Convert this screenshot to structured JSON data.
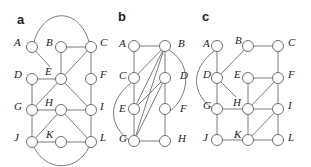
{
  "panels": [
    {
      "id": "a",
      "label": "a",
      "nodes": [
        {
          "id": "A",
          "label": "A"
        },
        {
          "id": "B",
          "label": "B"
        },
        {
          "id": "C",
          "label": "C"
        },
        {
          "id": "D",
          "label": "D"
        },
        {
          "id": "E",
          "label": "E"
        },
        {
          "id": "F",
          "label": "F"
        },
        {
          "id": "G",
          "label": "G"
        },
        {
          "id": "H",
          "label": "H"
        },
        {
          "id": "I",
          "label": "I"
        },
        {
          "id": "J",
          "label": "J"
        },
        {
          "id": "K",
          "label": "K"
        },
        {
          "id": "L",
          "label": "L"
        }
      ],
      "edges": [
        {
          "from": "A",
          "to": "C",
          "style": "arc-top"
        },
        {
          "from": "A",
          "to": "E",
          "style": "partial"
        },
        {
          "from": "B",
          "to": "C"
        },
        {
          "from": "B",
          "to": "E"
        },
        {
          "from": "C",
          "to": "E"
        },
        {
          "from": "C",
          "to": "F"
        },
        {
          "from": "D",
          "to": "E"
        },
        {
          "from": "D",
          "to": "G"
        },
        {
          "from": "E",
          "to": "G"
        },
        {
          "from": "E",
          "to": "I"
        },
        {
          "from": "F",
          "to": "I"
        },
        {
          "from": "G",
          "to": "H"
        },
        {
          "from": "H",
          "to": "I"
        },
        {
          "from": "G",
          "to": "J"
        },
        {
          "from": "H",
          "to": "J"
        },
        {
          "from": "H",
          "to": "L"
        },
        {
          "from": "I",
          "to": "L"
        },
        {
          "from": "J",
          "to": "K"
        },
        {
          "from": "K",
          "to": "L"
        },
        {
          "from": "J",
          "to": "L",
          "style": "arc-bottom"
        }
      ]
    },
    {
      "id": "b",
      "label": "b",
      "nodes": [
        {
          "id": "A",
          "label": "A"
        },
        {
          "id": "B",
          "label": "B"
        },
        {
          "id": "C",
          "label": "C"
        },
        {
          "id": "D",
          "label": "D"
        },
        {
          "id": "E",
          "label": "E"
        },
        {
          "id": "F",
          "label": "F"
        },
        {
          "id": "G",
          "label": "G"
        },
        {
          "id": "H",
          "label": "H"
        }
      ],
      "edges": [
        {
          "from": "A",
          "to": "B"
        },
        {
          "from": "A",
          "to": "C"
        },
        {
          "from": "C",
          "to": "E"
        },
        {
          "from": "E",
          "to": "G"
        },
        {
          "from": "G",
          "to": "H"
        },
        {
          "from": "B",
          "to": "D"
        },
        {
          "from": "D",
          "to": "F"
        },
        {
          "from": "F",
          "to": "H"
        },
        {
          "from": "B",
          "to": "C"
        },
        {
          "from": "B",
          "to": "E"
        },
        {
          "from": "B",
          "to": "G"
        },
        {
          "from": "D",
          "to": "E"
        },
        {
          "from": "D",
          "to": "G"
        },
        {
          "from": "B",
          "to": "F",
          "style": "arc-right"
        },
        {
          "from": "C",
          "to": "G",
          "style": "arc-left"
        }
      ]
    },
    {
      "id": "c",
      "label": "c",
      "nodes": [
        {
          "id": "A",
          "label": "A"
        },
        {
          "id": "B",
          "label": "B"
        },
        {
          "id": "C",
          "label": "C"
        },
        {
          "id": "D",
          "label": "D"
        },
        {
          "id": "E",
          "label": "E"
        },
        {
          "id": "F",
          "label": "F"
        },
        {
          "id": "G",
          "label": "G"
        },
        {
          "id": "H",
          "label": "H"
        },
        {
          "id": "I",
          "label": "I"
        },
        {
          "id": "J",
          "label": "J"
        },
        {
          "id": "K",
          "label": "K"
        },
        {
          "id": "L",
          "label": "L"
        }
      ],
      "edges": [
        {
          "from": "A",
          "to": "D"
        },
        {
          "from": "B",
          "to": "D"
        },
        {
          "from": "B",
          "to": "C"
        },
        {
          "from": "C",
          "to": "F"
        },
        {
          "from": "D",
          "to": "G"
        },
        {
          "from": "D",
          "to": "H",
          "style": "partial"
        },
        {
          "from": "E",
          "to": "F"
        },
        {
          "from": "E",
          "to": "H"
        },
        {
          "from": "F",
          "to": "H"
        },
        {
          "from": "F",
          "to": "I"
        },
        {
          "from": "G",
          "to": "H"
        },
        {
          "from": "H",
          "to": "I"
        },
        {
          "from": "H",
          "to": "K"
        },
        {
          "from": "I",
          "to": "K"
        },
        {
          "from": "I",
          "to": "L"
        },
        {
          "from": "G",
          "to": "J"
        },
        {
          "from": "J",
          "to": "K"
        },
        {
          "from": "K",
          "to": "L"
        },
        {
          "from": "A",
          "to": "G",
          "style": "arc-left"
        }
      ]
    }
  ]
}
